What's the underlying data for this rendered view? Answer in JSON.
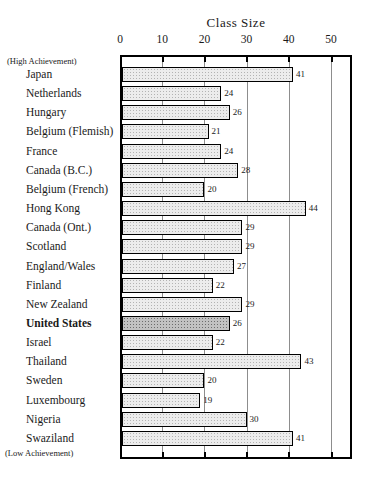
{
  "chart_data": {
    "type": "bar",
    "orientation": "horizontal",
    "title": "Class Size",
    "xlabel": "Class Size",
    "ylabel": "",
    "xlim": [
      0,
      55
    ],
    "x_ticks": [
      "0",
      "10",
      "20",
      "30",
      "40",
      "50"
    ],
    "grid": true,
    "data_labels": true,
    "annotations": {
      "top": "(High Achievement)",
      "bottom": "(Low Achievement)"
    },
    "categories": [
      "Japan",
      "Netherlands",
      "Hungary",
      "Belgium (Flemish)",
      "France",
      "Canada (B.C.)",
      "Belgium (French)",
      "Hong Kong",
      "Canada (Ont.)",
      "Scotland",
      "England/Wales",
      "Finland",
      "New Zealand",
      "United States",
      "Israel",
      "Thailand",
      "Sweden",
      "Luxembourg",
      "Nigeria",
      "Swaziland"
    ],
    "values": [
      41,
      24,
      26,
      21,
      24,
      28,
      20,
      44,
      29,
      29,
      27,
      22,
      29,
      26,
      22,
      43,
      20,
      19,
      30,
      41
    ],
    "highlight": {
      "category": "United States",
      "note": "dark hatched bar, bold label"
    }
  },
  "colors": {
    "background": "#ffffff",
    "bar_fill": "#ececec",
    "bar_dot": "#b3b3b3",
    "highlight_fill": "#c2c2c2",
    "highlight_dot": "#6d6d6d",
    "border": "#000000",
    "gridline": "#8d8d8d",
    "text": "#1a1a1a"
  }
}
